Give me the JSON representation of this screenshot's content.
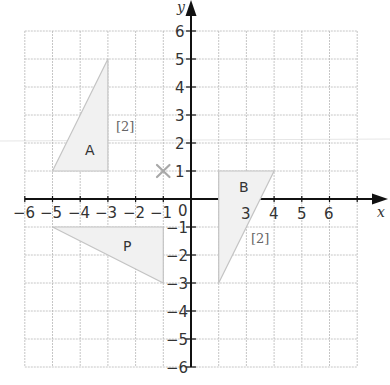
{
  "diagram": {
    "type": "coordinate-grid",
    "x_axis": {
      "label": "x",
      "min": -6,
      "max": 6
    },
    "y_axis": {
      "label": "y",
      "min": -6,
      "max": 6
    },
    "x_tick_labels": [
      "-6",
      "-5",
      "-4",
      "-3",
      "-2",
      "-1",
      "3",
      "4",
      "5",
      "6"
    ],
    "y_tick_labels": [
      "6",
      "5",
      "4",
      "3",
      "2",
      "1",
      "-1",
      "-2",
      "-3",
      "-4",
      "-5",
      "-6"
    ],
    "origin_label": "0",
    "shapes": [
      {
        "name": "A",
        "vertices": [
          [
            -5,
            1
          ],
          [
            -3,
            5
          ],
          [
            -3,
            1
          ]
        ]
      },
      {
        "name": "B",
        "vertices": [
          [
            1,
            1
          ],
          [
            3,
            1
          ],
          [
            1,
            -3
          ]
        ]
      },
      {
        "name": "P",
        "vertices": [
          [
            -5,
            -1
          ],
          [
            -1,
            -1
          ],
          [
            -1,
            -3
          ]
        ]
      }
    ],
    "marker": {
      "symbol": "×",
      "point": [
        -1,
        1
      ]
    },
    "marks": [
      {
        "text": "[2]",
        "near": "A"
      },
      {
        "text": "[2]",
        "near": "B"
      }
    ],
    "colors": {
      "grid": "#b8b8b8",
      "axis": "#111111",
      "shape_fill": "#f1f1f1",
      "shape_edge": "#c4c4c4",
      "marker": "#a8a8a8"
    }
  },
  "labels": {
    "x_axis_name": "x",
    "y_axis_name": "y",
    "origin": "0",
    "shape_A": "A",
    "shape_B": "B",
    "shape_P": "P",
    "marks_A": "[2]",
    "marks_B": "[2]",
    "x_ticks": {
      "n6": "−6",
      "n5": "−5",
      "n4": "−4",
      "n3": "−3",
      "n2": "−2",
      "n1": "−1",
      "p3": "3",
      "p4": "4",
      "p5": "5",
      "p6": "6"
    },
    "y_ticks": {
      "p6": "6",
      "p5": "5",
      "p4": "4",
      "p3": "3",
      "p2": "2",
      "p1": "1",
      "n1": "−1",
      "n2": "−2",
      "n3": "−3",
      "n4": "−4",
      "n5": "−5",
      "n6": "−6"
    }
  }
}
